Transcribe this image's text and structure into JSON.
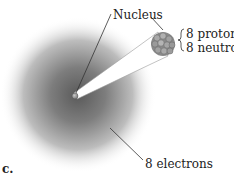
{
  "diagram": {
    "panel_label": "c.",
    "nucleus_label": "Nucleus",
    "nucleus_composition": {
      "protons": "8 protons",
      "neutrons": "8 neutrons"
    },
    "electrons_label": "8 electrons",
    "colors": {
      "cloud_center": "#5a5a5a",
      "cloud_edge": "#ffffff",
      "nucleus": "#9a9a9a",
      "beam": "#ffffff",
      "line": "#333333"
    }
  }
}
